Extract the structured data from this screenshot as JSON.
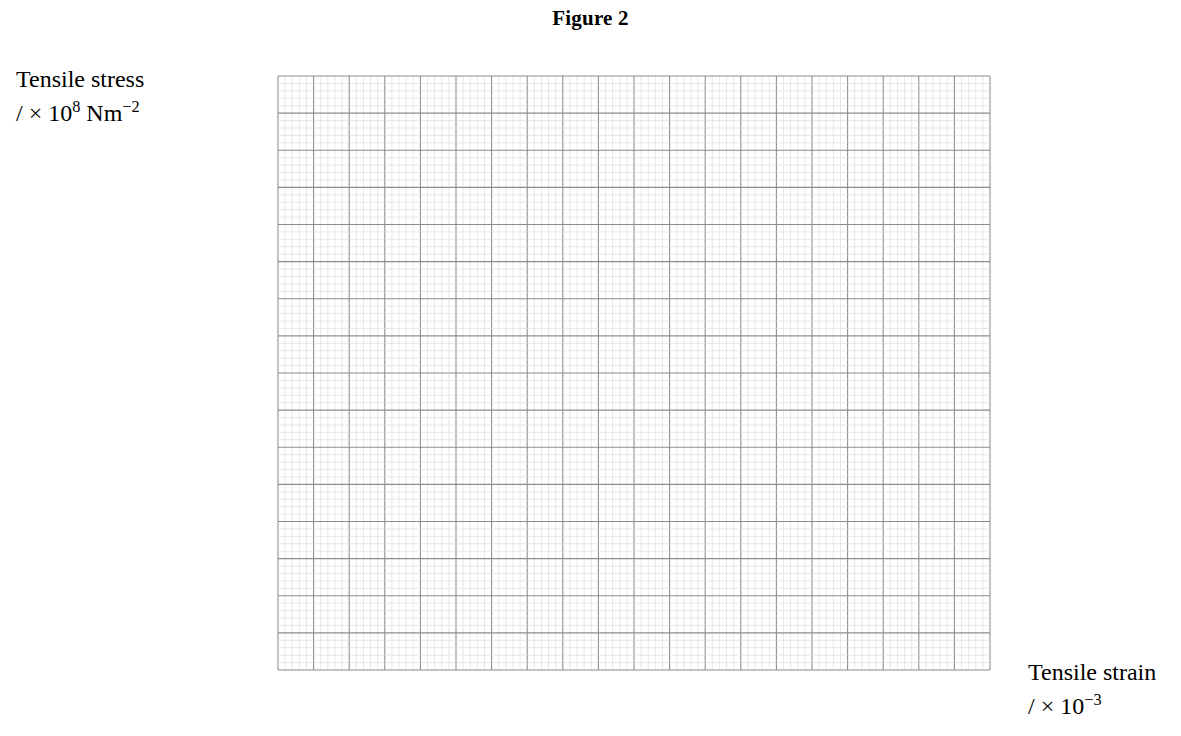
{
  "title": "Figure 2",
  "axes": {
    "y_label_line1": "Tensile stress",
    "y_label_line2_prefix": "/ × 10",
    "y_label_line2_exp": "8",
    "y_label_line2_suffix": " Nm",
    "y_label_line2_unit_exp": "−2",
    "x_label_line1": "Tensile strain",
    "x_label_line2_prefix": "/ × 10",
    "x_label_line2_exp": "−3",
    "x_ticks": [
      "0",
      "5.0",
      "10.0",
      "15.0"
    ],
    "x_tick_values": [
      0,
      5,
      10,
      15
    ],
    "y_ticks": [
      "0",
      "2.0",
      "4.0",
      "6.0",
      "8.0"
    ],
    "y_tick_values": [
      0,
      2,
      4,
      6,
      8
    ],
    "origin_label": "0"
  },
  "colors": {
    "ink": "#1a1a1a",
    "grid_major": "#8b8b93",
    "grid_medium": "#a9a9b2",
    "grid_minor": "#d4d4da",
    "curve": "#333338"
  },
  "chart_data": {
    "type": "scatter",
    "title": "Figure 2",
    "xlabel": "Tensile strain / × 10⁻³",
    "ylabel": "Tensile stress / × 10⁸ Nm⁻²",
    "xlim": [
      0,
      20
    ],
    "ylim": [
      0,
      8
    ],
    "grid": true,
    "legend": "none",
    "x": [
      2.5,
      5.0,
      7.5,
      10.0,
      12.5,
      15.0,
      17.8
    ],
    "y": [
      1.0,
      2.0,
      3.0,
      4.0,
      5.0,
      6.0,
      6.8
    ],
    "xerr": [
      0.55,
      0.9,
      1.25,
      1.45,
      1.55,
      1.5,
      1.45
    ],
    "yerr": [
      0.06,
      0.12,
      0.17,
      0.2,
      0.26,
      0.3,
      0.14
    ],
    "series": [
      {
        "name": "stress-strain",
        "points": [
          {
            "x": 2.5,
            "y": 1.0,
            "xerr": 0.55,
            "yerr": 0.06
          },
          {
            "x": 5.0,
            "y": 2.0,
            "xerr": 0.9,
            "yerr": 0.12
          },
          {
            "x": 7.5,
            "y": 3.0,
            "xerr": 1.25,
            "yerr": 0.17
          },
          {
            "x": 10.0,
            "y": 4.0,
            "xerr": 1.45,
            "yerr": 0.2
          },
          {
            "x": 12.5,
            "y": 5.0,
            "xerr": 1.55,
            "yerr": 0.26
          },
          {
            "x": 15.0,
            "y": 6.0,
            "xerr": 1.5,
            "yerr": 0.3
          },
          {
            "x": 17.8,
            "y": 6.8,
            "xerr": 1.45,
            "yerr": 0.14
          }
        ]
      }
    ],
    "curve": [
      {
        "x": 0.0,
        "y": 0.0
      },
      {
        "x": 2.5,
        "y": 1.0
      },
      {
        "x": 5.0,
        "y": 2.0
      },
      {
        "x": 7.5,
        "y": 3.0
      },
      {
        "x": 10.0,
        "y": 4.0
      },
      {
        "x": 12.5,
        "y": 5.0
      },
      {
        "x": 14.6,
        "y": 5.86
      },
      {
        "x": 15.6,
        "y": 6.3
      },
      {
        "x": 16.4,
        "y": 6.56
      },
      {
        "x": 17.2,
        "y": 6.72
      },
      {
        "x": 18.0,
        "y": 6.79
      },
      {
        "x": 19.0,
        "y": 6.8
      }
    ],
    "plateau_value": 6.8
  },
  "geometry": {
    "plot_left": 278,
    "plot_right": 990,
    "plot_top": 76,
    "plot_bottom": 670,
    "x_units_across": 20,
    "y_units_up": 8
  }
}
